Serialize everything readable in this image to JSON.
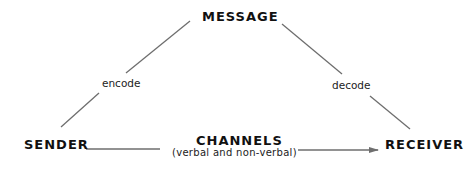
{
  "diagram": {
    "nodes": {
      "message": "MESSAGE",
      "sender": "SENDER",
      "receiver": "RECEIVER",
      "channels": "CHANNELS"
    },
    "edge_labels": {
      "encode": "encode",
      "decode": "decode",
      "channels_sub": "(verbal and non-verbal)"
    },
    "colors": {
      "line": "#6e6e6e",
      "text": "#111111"
    },
    "edges": [
      {
        "from": "SENDER",
        "to": "MESSAGE",
        "label": "encode"
      },
      {
        "from": "MESSAGE",
        "to": "RECEIVER",
        "label": "decode"
      },
      {
        "from": "SENDER",
        "to": "RECEIVER",
        "label": "CHANNELS (verbal and non-verbal)",
        "arrow": true
      }
    ]
  }
}
